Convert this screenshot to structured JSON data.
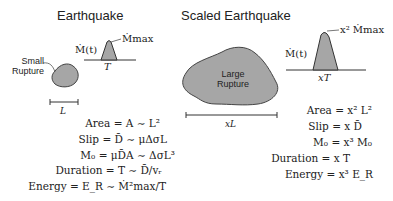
{
  "left": {
    "title": "Earthquake",
    "rupture_label_line1": "Small",
    "rupture_label_line2": "Rupture",
    "moment_rate_label": "Ṁ(t)",
    "peak_label": "Ṁmax",
    "duration_label": "T",
    "length_label": "L",
    "equations": [
      {
        "lhs": "Area",
        "rhs": "= A ∼ L²"
      },
      {
        "lhs": "Slip",
        "rhs": "= D̄ ∼ μΔσL"
      },
      {
        "lhs": "M₀",
        "rhs": "= μD̄A ∼ ΔσL³"
      },
      {
        "lhs": "Duration",
        "rhs": "= T ∼ D̄/vᵣ"
      },
      {
        "lhs": "Energy",
        "rhs": "= E_R ∼ Ṁ²max/T"
      }
    ]
  },
  "right": {
    "title": "Scaled Earthquake",
    "rupture_label_line1": "Large",
    "rupture_label_line2": "Rupture",
    "moment_rate_label": "Ṁ(t)",
    "peak_label": "x² Ṁmax",
    "duration_label": "xT",
    "length_label": "xL",
    "equations": [
      {
        "lhs": "Area",
        "rhs": "= x² L²"
      },
      {
        "lhs": "Slip",
        "rhs": "= x D̄"
      },
      {
        "lhs": "M₀",
        "rhs": "= x³ M₀"
      },
      {
        "lhs": "Duration",
        "rhs": "= x T"
      },
      {
        "lhs": "Energy",
        "rhs": "= x³ E_R"
      }
    ]
  },
  "colors": {
    "shape_fill": "#a6a6a6",
    "stroke": "#333333",
    "text": "#222222"
  }
}
